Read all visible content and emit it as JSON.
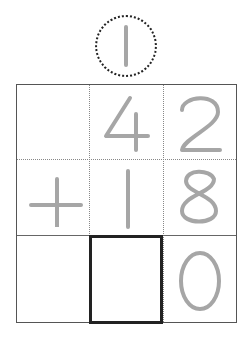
{
  "carry": {
    "digit": "1",
    "style": "dotted-circle"
  },
  "problem": {
    "operator": "+",
    "top_number": [
      "",
      "4",
      "2"
    ],
    "bottom_number": [
      "+",
      "1",
      "8"
    ],
    "answer": [
      "",
      "",
      "0"
    ],
    "answer_blank_position": 1
  },
  "colors": {
    "digit": "#a6a6a6",
    "grid": "#555555",
    "answer_box": "#222222"
  }
}
